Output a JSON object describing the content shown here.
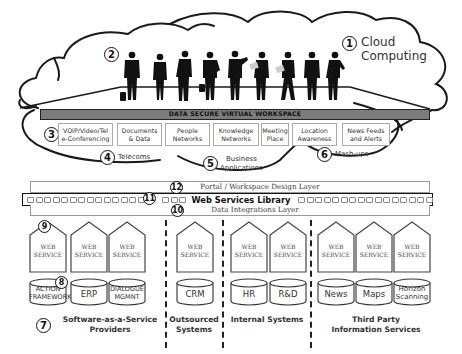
{
  "cloud": {
    "number": "1",
    "title_line1": "Cloud",
    "title_line2": "Computing"
  },
  "people": {
    "number": "2",
    "count": 9
  },
  "workspace": {
    "bar_label": "DATA SECURE VIRTUAL WORKSPACE",
    "services": [
      {
        "line1": "VOIP/Video/Tel",
        "line2": "e-Conferencing"
      },
      {
        "line1": "Documents",
        "line2": "& Data"
      },
      {
        "line1": "People",
        "line2": "Networks"
      },
      {
        "line1": "Knowledge",
        "line2": "Networks"
      },
      {
        "line1": "Meeting",
        "line2": "Place"
      },
      {
        "line1": "Location",
        "line2": "Awareness"
      },
      {
        "line1": "News Feeds",
        "line2": "and Alerts"
      }
    ]
  },
  "bubbles": {
    "voip_number": "3",
    "telecoms": {
      "number": "4",
      "label": "Telecoms"
    },
    "business": {
      "number": "5",
      "line1": "Business",
      "line2": "Applications"
    },
    "mashups": {
      "number": "6",
      "label": "Mash-ups"
    }
  },
  "layers": {
    "portal": {
      "number": "12",
      "label": "Portal / Workspace Design Layer"
    },
    "library": {
      "number": "11",
      "label": "Web Services Library"
    },
    "data": {
      "number": "10",
      "label": "Data Integrations Layer"
    }
  },
  "web_service": {
    "number": "9",
    "line1": "WEB",
    "line2": "SERVICE"
  },
  "database_number": "8",
  "groups": [
    {
      "number": "7",
      "line1": "Software-as-a-Service",
      "line2": "Providers",
      "databases": [
        {
          "line1": "ACTION",
          "line2": "FRAMEWORK"
        },
        {
          "line1": "ERP"
        },
        {
          "line1": "DIALOGUE",
          "line2": "MGMNT"
        }
      ]
    },
    {
      "line1": "Outsourced",
      "line2": "Systems",
      "databases": [
        {
          "line1": "CRM"
        }
      ]
    },
    {
      "line1": "Internal Systems",
      "databases": [
        {
          "line1": "HR"
        },
        {
          "line1": "R&D"
        }
      ]
    },
    {
      "line1": "Third Party",
      "line2": "Information Services",
      "databases": [
        {
          "line1": "News"
        },
        {
          "line1": "Maps"
        },
        {
          "line1": "Horizon",
          "line2": "Scanning"
        }
      ]
    }
  ],
  "colors": {
    "bar": "#7c7c7c",
    "outline": "#111111",
    "box_border": "#aaaaaa"
  }
}
